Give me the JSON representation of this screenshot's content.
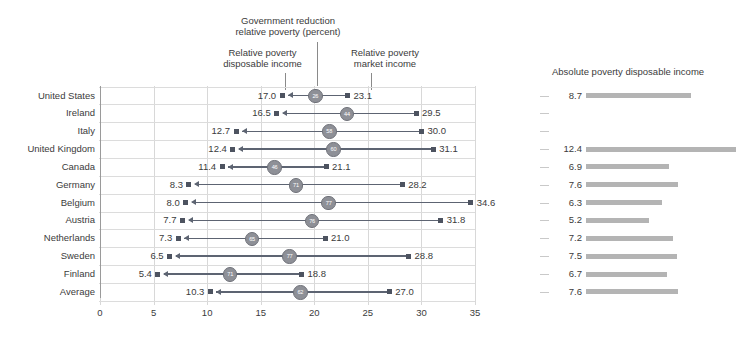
{
  "annotations": {
    "center": "Government reduction\nrelative poverty (percent)",
    "left": "Relative poverty\ndisposable income",
    "right": "Relative poverty\nmarket income"
  },
  "right_panel": {
    "title": "Absolute poverty disposable income"
  },
  "axis": {
    "ticks": [
      "0",
      "5",
      "10",
      "15",
      "20",
      "25",
      "30",
      "35"
    ],
    "min": 0,
    "max": 35,
    "step": 5
  },
  "chart_data": {
    "type": "bar",
    "title": "Government reduction relative poverty (percent)",
    "xlabel": "",
    "ylabel": "",
    "xlim": [
      0,
      35
    ],
    "grid": true,
    "legend": [
      "Relative poverty disposable income",
      "Government reduction relative poverty (percent)",
      "Relative poverty market income"
    ],
    "categories": [
      "United States",
      "Ireland",
      "Italy",
      "United Kingdom",
      "Canada",
      "Germany",
      "Belgium",
      "Austria",
      "Netherlands",
      "Sweden",
      "Finland",
      "Average"
    ],
    "series": [
      {
        "name": "Relative poverty disposable income",
        "values": [
          17.0,
          16.5,
          12.7,
          12.4,
          11.4,
          8.3,
          8.0,
          7.7,
          7.3,
          6.5,
          5.4,
          10.3
        ]
      },
      {
        "name": "Relative poverty market income",
        "values": [
          23.1,
          29.5,
          30.0,
          31.1,
          21.1,
          28.2,
          34.6,
          31.8,
          21.0,
          28.8,
          18.8,
          27.0
        ]
      },
      {
        "name": "Government reduction relative poverty (percent)",
        "values": [
          26,
          44,
          58,
          60,
          46,
          71,
          77,
          76,
          65,
          77,
          71,
          62
        ]
      },
      {
        "name": "Absolute poverty disposable income",
        "values": [
          8.7,
          null,
          null,
          12.4,
          6.9,
          7.6,
          6.3,
          5.2,
          7.2,
          7.5,
          6.7,
          7.6
        ]
      }
    ],
    "rows": [
      {
        "label": "United States",
        "disposable": "17.0",
        "market": "23.1",
        "reduction": "26",
        "absolute": "8.7"
      },
      {
        "label": "Ireland",
        "disposable": "16.5",
        "market": "29.5",
        "reduction": "44",
        "absolute": ""
      },
      {
        "label": "Italy",
        "disposable": "12.7",
        "market": "30.0",
        "reduction": "58",
        "absolute": ""
      },
      {
        "label": "United Kingdom",
        "disposable": "12.4",
        "market": "31.1",
        "reduction": "60",
        "absolute": "12.4"
      },
      {
        "label": "Canada",
        "disposable": "11.4",
        "market": "21.1",
        "reduction": "46",
        "absolute": "6.9"
      },
      {
        "label": "Germany",
        "disposable": "8.3",
        "market": "28.2",
        "reduction": "71",
        "absolute": "7.6"
      },
      {
        "label": "Belgium",
        "disposable": "8.0",
        "market": "34.6",
        "reduction": "77",
        "absolute": "6.3"
      },
      {
        "label": "Austria",
        "disposable": "7.7",
        "market": "31.8",
        "reduction": "76",
        "absolute": "5.2"
      },
      {
        "label": "Netherlands",
        "disposable": "7.3",
        "market": "21.0",
        "reduction": "65",
        "absolute": "7.2"
      },
      {
        "label": "Sweden",
        "disposable": "6.5",
        "market": "28.8",
        "reduction": "77",
        "absolute": "7.5"
      },
      {
        "label": "Finland",
        "disposable": "5.4",
        "market": "18.8",
        "reduction": "71",
        "absolute": "6.7"
      },
      {
        "label": "Average",
        "disposable": "10.3",
        "market": "27.0",
        "reduction": "62",
        "absolute": "7.6"
      }
    ]
  },
  "colors": {
    "marker": "#4d5360",
    "connector": "#5d6472",
    "circle": "#8e9097",
    "bar": "#b4b4b4",
    "grid": "#d8d8d8",
    "text": "#3b3b3b"
  }
}
